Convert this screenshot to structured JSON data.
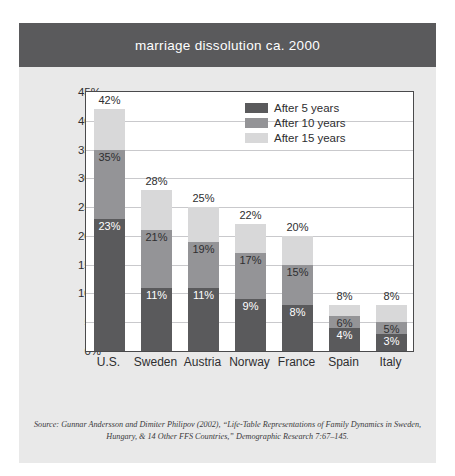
{
  "title": "marriage dissolution ca. 2000",
  "legend": [
    {
      "label": "After 5 years",
      "color": "#5a5a5c",
      "key": "after_5"
    },
    {
      "label": "After 10 years",
      "color": "#949497",
      "key": "after_10"
    },
    {
      "label": "After 15 years",
      "color": "#d8d8d9",
      "key": "after_15"
    }
  ],
  "source": {
    "line1": "Source: Gunnar Andersson and Dimiter Philipov (2002), “Life-Table Representations of Family Dynamics in Sweden,",
    "line2": "Hungary, & 14 Other FFS Countries,” Demographic Research 7:67–145."
  },
  "chart_data": {
    "type": "bar",
    "title": "marriage dissolution ca. 2000",
    "xlabel": "",
    "ylabel": "",
    "ylim": [
      0,
      45
    ],
    "ytick_labels": [
      "0%",
      "5%",
      "10%",
      "15%",
      "20%",
      "25%",
      "30%",
      "35%",
      "40%",
      "45%"
    ],
    "ytick_values": [
      0,
      5,
      10,
      15,
      20,
      25,
      30,
      35,
      40,
      45
    ],
    "grid": true,
    "legend_position": "upper right",
    "overlap_style": "overlapping",
    "categories": [
      "U.S.",
      "Sweden",
      "Austria",
      "Norway",
      "France",
      "Spain",
      "Italy"
    ],
    "series": [
      {
        "name": "After 5 years",
        "values": [
          23,
          11,
          11,
          9,
          8,
          4,
          3
        ],
        "labels": [
          "23%",
          "11%",
          "11%",
          "9%",
          "8%",
          "4%",
          "3%"
        ]
      },
      {
        "name": "After 10 years",
        "values": [
          35,
          21,
          19,
          17,
          15,
          6,
          5
        ],
        "labels": [
          "35%",
          "21%",
          "19%",
          "17%",
          "15%",
          "6%",
          "5%"
        ]
      },
      {
        "name": "After 15 years",
        "values": [
          42,
          28,
          25,
          22,
          20,
          8,
          8
        ],
        "labels": [
          "42%",
          "28%",
          "25%",
          "22%",
          "20%",
          "8%",
          "8%"
        ]
      }
    ]
  }
}
